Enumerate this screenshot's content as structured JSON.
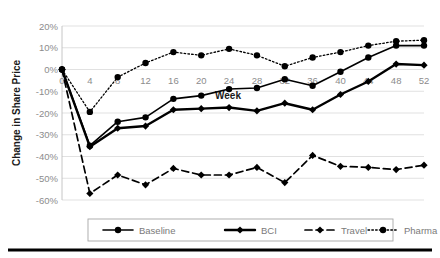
{
  "chart_data": {
    "type": "line",
    "title": "",
    "xlabel": "Week",
    "ylabel": "Change in Share Price",
    "xlim": [
      0,
      52
    ],
    "ylim": [
      -60,
      20
    ],
    "xticks": [
      0,
      4,
      8,
      12,
      16,
      20,
      24,
      28,
      32,
      36,
      40,
      44,
      48,
      52
    ],
    "xtick_labels": [
      "0",
      "4",
      "8",
      "12",
      "16",
      "20",
      "24",
      "28",
      "32",
      "36",
      "40",
      "44",
      "48",
      "52"
    ],
    "yticks": [
      20,
      10,
      0,
      -10,
      -20,
      -30,
      -40,
      -50,
      -60
    ],
    "ytick_labels": [
      "20%",
      "10%",
      "0%",
      "-10%",
      "-20%",
      "-30%",
      "-40%",
      "-50%",
      "-60%"
    ],
    "grid": true,
    "legend_position": "bottom",
    "x": [
      0,
      4,
      8,
      12,
      16,
      20,
      24,
      28,
      32,
      36,
      40,
      44,
      48,
      52
    ],
    "series": [
      {
        "name": "Baseline",
        "style": "solid",
        "marker": "circle",
        "values": [
          0,
          -35,
          -24,
          -22,
          -13.5,
          -12,
          -9,
          -8.5,
          -4.5,
          -7.5,
          -1,
          5.5,
          11,
          11
        ]
      },
      {
        "name": "BCI",
        "style": "solid-thick",
        "marker": "diamond",
        "values": [
          0,
          -35.5,
          -27,
          -26,
          -18.5,
          -18,
          -17.5,
          -19,
          -15.5,
          -18.5,
          -11.5,
          -5.5,
          2.5,
          2
        ]
      },
      {
        "name": "Travel",
        "style": "dashed",
        "marker": "diamond",
        "values": [
          0,
          -57,
          -48.5,
          -53,
          -45.5,
          -48.5,
          -48.5,
          -45,
          -52,
          -39.5,
          -44.5,
          -45,
          -46,
          -44
        ]
      },
      {
        "name": "Pharma",
        "style": "dotted",
        "marker": "circle",
        "values": [
          0,
          -19.5,
          -3.5,
          3,
          8,
          6.5,
          9.5,
          6.5,
          1.5,
          5.5,
          8,
          11,
          13,
          13.5
        ]
      }
    ]
  },
  "axes": {
    "y_title": "Change in Share Price",
    "x_title": "Week"
  },
  "legend": {
    "entries": [
      {
        "label": "Baseline"
      },
      {
        "label": "BCI"
      },
      {
        "label": "Travel"
      },
      {
        "label": "Pharma"
      }
    ]
  }
}
